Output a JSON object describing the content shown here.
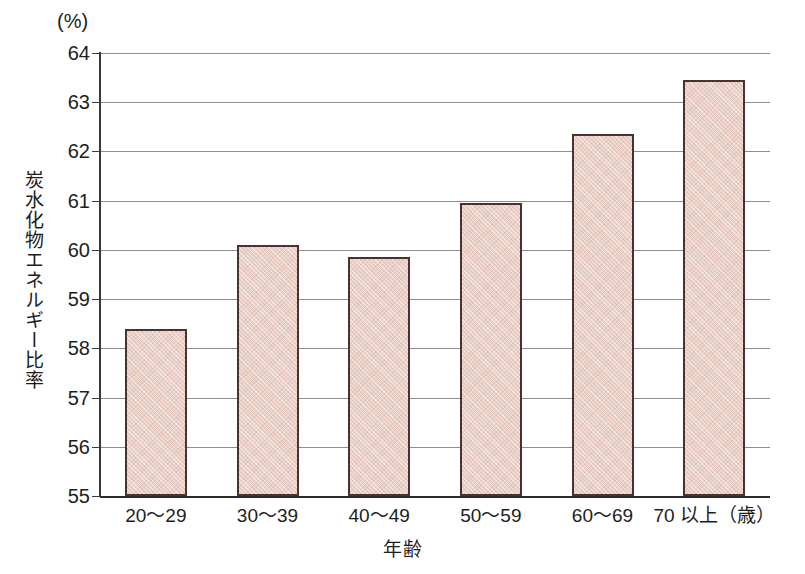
{
  "chart_data": {
    "type": "bar",
    "title": "",
    "subtitle": "",
    "xlabel": "年齢",
    "ylabel": "炭水化物エネルギー比率",
    "unit_label": "(%)",
    "categories": [
      "20～29",
      "30～39",
      "40～49",
      "50～59",
      "60～69",
      "70 以上（歳）"
    ],
    "values": [
      58.4,
      60.1,
      59.85,
      60.95,
      62.35,
      63.45
    ],
    "ylim": [
      55,
      64
    ],
    "ytick_labels": [
      "64",
      "63",
      "62",
      "61",
      "60",
      "59",
      "58",
      "57",
      "56",
      "55"
    ],
    "ytick_values": [
      64,
      63,
      62,
      61,
      60,
      59,
      58,
      57,
      56,
      55
    ],
    "grid": true,
    "legend": "none",
    "bar_fill_color": "#e9cfc6",
    "bar_border_color": "#4a332e",
    "gridline_color": "#8d8d8d",
    "axis_color": "#3a3a3a",
    "text_color": "#1d1d1d"
  }
}
